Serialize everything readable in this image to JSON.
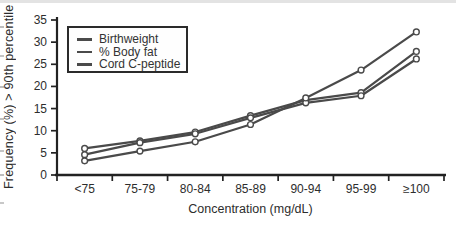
{
  "chart_data": {
    "type": "line",
    "title": "",
    "xlabel": "Concentration (mg/dL)",
    "ylabel": "Frequency (%) > 90th percentile",
    "categories": [
      "<75",
      "75-79",
      "80-84",
      "85-89",
      "90-94",
      "95-99",
      "≥100"
    ],
    "series": [
      {
        "name": "Birthweight",
        "color": "#4a4a4a",
        "values": [
          6.0,
          7.7,
          9.7,
          13.4,
          16.9,
          18.6,
          27.9
        ]
      },
      {
        "name": "% Body fat",
        "color": "#4a4a4a",
        "values": [
          4.6,
          7.3,
          9.3,
          12.9,
          16.3,
          17.9,
          26.2
        ]
      },
      {
        "name": "Cord C-peptide",
        "color": "#4a4a4a",
        "values": [
          3.2,
          5.4,
          7.5,
          11.4,
          17.4,
          23.7,
          32.3
        ]
      }
    ],
    "ylim": [
      0,
      35
    ],
    "yticks": [
      0,
      5,
      10,
      15,
      20,
      25,
      30,
      35
    ],
    "grid": false,
    "legend_position": "top-left",
    "marker": "open-circle",
    "axis_color": "#222222",
    "text_color": "#2d2d2d"
  }
}
